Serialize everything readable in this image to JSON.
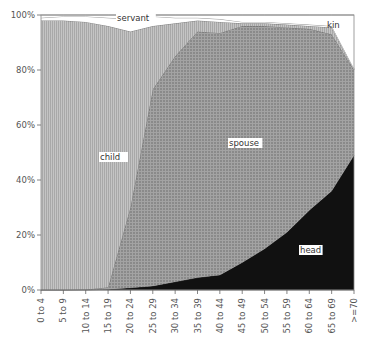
{
  "chart_data": {
    "type": "area",
    "stacked": true,
    "normalized": true,
    "title": "",
    "xlabel": "",
    "ylabel": "",
    "ylim": [
      0,
      100
    ],
    "y_ticks": [
      "0%",
      "20%",
      "40%",
      "60%",
      "80%",
      "100%"
    ],
    "categories": [
      "0 to 4",
      "5 to 9",
      "10 to 14",
      "15 to 19",
      "20 to 24",
      "25 to 29",
      "30 to 34",
      "35 to 39",
      "40 to 44",
      "45 to 49",
      "50 to 54",
      "55 to 59",
      "60 to 64",
      "65 to 69",
      ">=70"
    ],
    "series": [
      {
        "name": "head",
        "values": [
          0,
          0,
          0,
          0.3,
          0.8,
          1.5,
          3,
          4.5,
          5.5,
          10,
          15,
          21,
          29,
          36,
          49
        ],
        "color": "#111111"
      },
      {
        "name": "spouse",
        "values": [
          0,
          0,
          0.2,
          0.7,
          29.2,
          71.5,
          82,
          89.5,
          88,
          86,
          81,
          74.5,
          66,
          57,
          31
        ],
        "color": "#8c8c8c"
      },
      {
        "name": "child",
        "values": [
          98,
          98,
          97.3,
          95,
          64,
          23,
          12,
          4,
          4,
          1,
          1,
          1,
          1,
          2.5,
          0
        ],
        "color": "#b9b9b9"
      },
      {
        "name": "servant",
        "values": [
          1,
          1.5,
          2,
          3,
          4.5,
          3.5,
          2,
          1,
          1,
          0.5,
          0.5,
          0.5,
          0.5,
          0.5,
          0.5
        ],
        "color": "#ffffff"
      },
      {
        "name": "kin",
        "values": [
          1,
          0.5,
          0.5,
          1,
          1.5,
          0.5,
          1,
          1,
          1.5,
          2.5,
          2.5,
          3,
          3.5,
          4,
          19.5
        ],
        "color": "#ffffff"
      }
    ],
    "legend_position": "inline-labels",
    "grid": false
  },
  "labels": {
    "head": "head",
    "spouse": "spouse",
    "child": "child",
    "servant": "servant",
    "kin": "kin"
  }
}
